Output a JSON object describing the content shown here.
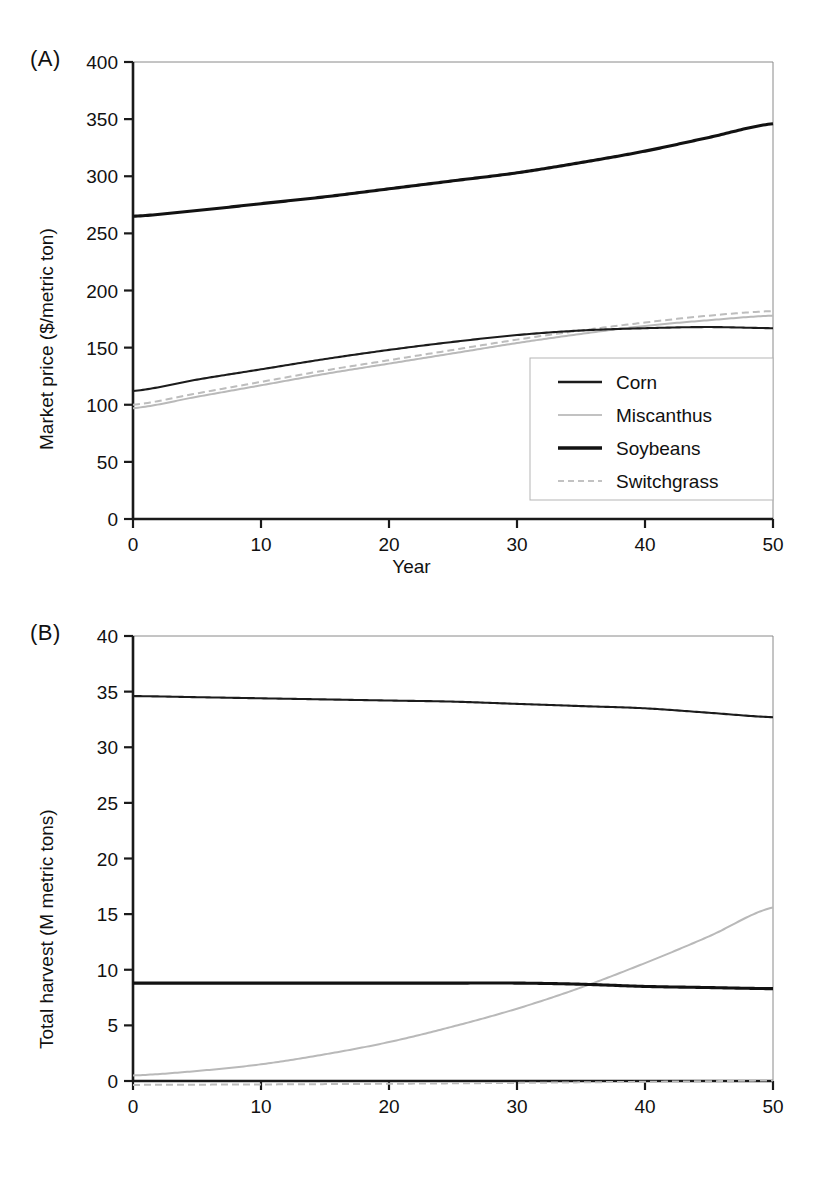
{
  "figure": {
    "panels": [
      {
        "tag": "(A)",
        "ylabel": "Market price ($/metric ton)",
        "xlabel": "Year"
      },
      {
        "tag": "(B)",
        "ylabel": "Total harvest (M metric tons)",
        "xlabel": "Year"
      }
    ],
    "legend": {
      "items": [
        {
          "label": "Corn",
          "style": "solid-dark-thin",
          "color": "#1c1c1c"
        },
        {
          "label": "Miscanthus",
          "style": "solid-light",
          "color": "#b9b9b9"
        },
        {
          "label": "Soybeans",
          "style": "solid-dark-thick",
          "color": "#121212"
        },
        {
          "label": "Switchgrass",
          "style": "dashed-light",
          "color": "#bdbdbd"
        }
      ],
      "position": "panel-A-lower-right"
    }
  },
  "chart_data": [
    {
      "type": "line",
      "panel": "(A)",
      "title": "",
      "xlabel": "Year",
      "ylabel": "Market price ($/metric ton)",
      "xlim": [
        0,
        50
      ],
      "ylim": [
        0,
        400
      ],
      "xticks": [
        0,
        10,
        20,
        30,
        40,
        50
      ],
      "yticks": [
        0,
        50,
        100,
        150,
        200,
        250,
        300,
        350,
        400
      ],
      "grid": false,
      "legend": [
        "Corn",
        "Miscanthus",
        "Soybeans",
        "Switchgrass"
      ],
      "x": [
        0,
        5,
        10,
        15,
        20,
        25,
        30,
        35,
        40,
        45,
        50
      ],
      "series": [
        {
          "name": "Corn",
          "values": [
            112,
            122,
            131,
            140,
            148,
            155,
            161,
            165,
            167,
            168,
            167
          ]
        },
        {
          "name": "Miscanthus",
          "values": [
            97,
            107,
            117,
            127,
            136,
            145,
            154,
            162,
            169,
            174,
            178
          ]
        },
        {
          "name": "Soybeans",
          "values": [
            265,
            270,
            276,
            282,
            289,
            296,
            303,
            312,
            322,
            334,
            346
          ]
        },
        {
          "name": "Switchgrass",
          "values": [
            100,
            110,
            120,
            130,
            139,
            148,
            157,
            165,
            172,
            178,
            182
          ]
        }
      ]
    },
    {
      "type": "line",
      "panel": "(B)",
      "title": "",
      "xlabel": "Year",
      "ylabel": "Total harvest (M metric tons)",
      "xlim": [
        0,
        50
      ],
      "ylim": [
        0,
        40
      ],
      "xticks": [
        0,
        10,
        20,
        30,
        40,
        50
      ],
      "yticks": [
        0,
        5,
        10,
        15,
        20,
        25,
        30,
        35,
        40
      ],
      "grid": false,
      "legend": [
        "Corn",
        "Miscanthus",
        "Soybeans",
        "Switchgrass"
      ],
      "x": [
        0,
        5,
        10,
        15,
        20,
        25,
        30,
        35,
        40,
        45,
        50
      ],
      "series": [
        {
          "name": "Corn",
          "values": [
            34.6,
            34.5,
            34.4,
            34.3,
            34.2,
            34.1,
            33.9,
            33.7,
            33.5,
            33.1,
            32.7
          ]
        },
        {
          "name": "Miscanthus",
          "values": [
            0.5,
            0.9,
            1.5,
            2.4,
            3.5,
            4.9,
            6.5,
            8.4,
            10.6,
            13.0,
            15.6
          ]
        },
        {
          "name": "Soybeans",
          "values": [
            8.8,
            8.8,
            8.8,
            8.8,
            8.8,
            8.8,
            8.8,
            8.7,
            8.5,
            8.4,
            8.3
          ]
        },
        {
          "name": "Switchgrass",
          "values": [
            -0.35,
            -0.33,
            -0.31,
            -0.28,
            -0.25,
            -0.21,
            -0.17,
            -0.12,
            -0.07,
            -0.02,
            0.05
          ]
        }
      ]
    }
  ]
}
